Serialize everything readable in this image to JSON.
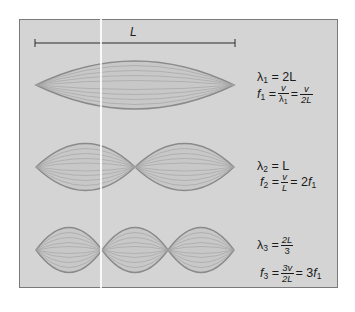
{
  "figure": {
    "length_label": "L",
    "colors": {
      "panel_bg": "#d4d4d4",
      "panel_border": "#7a7a7a",
      "wave_outline": "#8a8a8a",
      "wave_inner": "#9e9e9e",
      "text": "#1a1a1a"
    }
  },
  "modes": [
    {
      "name": "first harmonic",
      "loops": 1,
      "lambda_symbol": "λ",
      "lambda_sub": "1",
      "lambda_eq": "= 2L",
      "f_symbol": "f",
      "f_sub": "1",
      "f_expr": "= v/λ1 = v/2L",
      "f_frac1_num": "v",
      "f_frac1_den": "λ",
      "f_frac1_den_sub": "1",
      "f_frac2_num": "v",
      "f_frac2_den": "2L"
    },
    {
      "name": "second harmonic",
      "loops": 2,
      "lambda_symbol": "λ",
      "lambda_sub": "2",
      "lambda_eq": "= L",
      "f_symbol": "f",
      "f_sub": "2",
      "f_frac_num": "v",
      "f_frac_den": "L",
      "f_result": "= 2",
      "f_result_f": "f",
      "f_result_sub": "1"
    },
    {
      "name": "third harmonic",
      "loops": 3,
      "lambda_symbol": "λ",
      "lambda_sub": "3",
      "lambda_frac_num": "2L",
      "lambda_frac_den": "3",
      "f_symbol": "f",
      "f_sub": "3",
      "f_frac_num": "3v",
      "f_frac_den": "2L",
      "f_result": "= 3",
      "f_result_f": "f",
      "f_result_sub": "1"
    }
  ],
  "equals": "="
}
